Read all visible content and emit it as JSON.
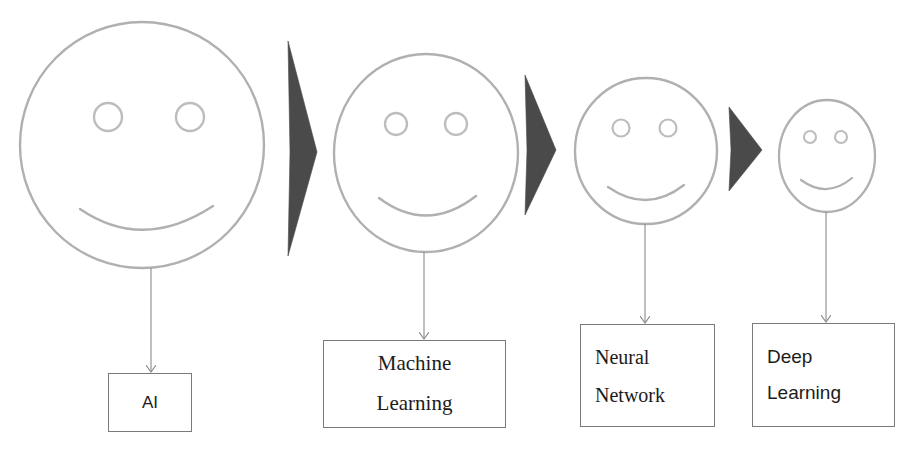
{
  "diagram": {
    "background_color": "#ffffff",
    "face_stroke_color": "#b0b0b0",
    "eye_stroke_color": "#bdbdbd",
    "chevron_color": "#4a4a4a",
    "arrow_color": "#8a8a8a",
    "box_border_color": "#7a7a7a",
    "text_color": "#1c1c1c"
  },
  "stages": [
    {
      "id": "ai",
      "face_label": "smiley-face-large",
      "relative_size": "largest",
      "box": {
        "lines": [
          "AI"
        ],
        "align": "center",
        "font": "sans"
      }
    },
    {
      "id": "machine-learning",
      "face_label": "smiley-face-medium-large",
      "relative_size": "large",
      "box": {
        "lines": [
          "Machine",
          "Learning"
        ],
        "align": "center",
        "font": "serif"
      }
    },
    {
      "id": "neural-network",
      "face_label": "smiley-face-medium",
      "relative_size": "medium",
      "box": {
        "lines": [
          "Neural",
          "Network"
        ],
        "align": "left",
        "font": "serif"
      }
    },
    {
      "id": "deep-learning",
      "face_label": "smiley-face-small",
      "relative_size": "smallest",
      "box": {
        "lines": [
          "Deep",
          "Learning"
        ],
        "align": "left",
        "font": "sans"
      }
    }
  ],
  "connectors": {
    "chevrons": [
      "chevron-1",
      "chevron-2",
      "chevron-3"
    ],
    "arrows": [
      "arrow-to-ai",
      "arrow-to-machine-learning",
      "arrow-to-neural-network",
      "arrow-to-deep-learning"
    ]
  }
}
